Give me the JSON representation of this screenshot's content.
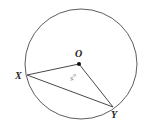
{
  "diagram": {
    "type": "circle-geometry",
    "circle": {
      "cx": 80,
      "cy": 64,
      "r": 55,
      "stroke": "#333333"
    },
    "center": {
      "label": "O",
      "x": 79,
      "y": 64
    },
    "points": [
      {
        "label": "X",
        "x": 27,
        "y": 75
      },
      {
        "label": "Y",
        "x": 113,
        "y": 107
      }
    ],
    "angle": {
      "label": "x°",
      "at": "O"
    },
    "segments": [
      "OX",
      "OY",
      "XY"
    ]
  }
}
